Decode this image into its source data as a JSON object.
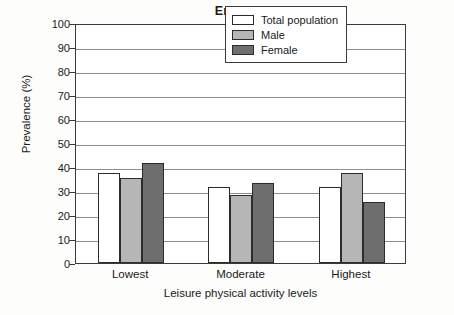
{
  "chart_data": {
    "type": "bar",
    "title": "England",
    "xlabel": "Leisure physical activity levels",
    "ylabel": "Prevalence (%)",
    "categories": [
      "Lowest",
      "Moderate",
      "Highest"
    ],
    "series": [
      {
        "name": "Total population",
        "values": [
          37.5,
          31.5,
          31.5
        ],
        "color": "#ffffff"
      },
      {
        "name": "Male",
        "values": [
          35.5,
          28.5,
          37.5
        ],
        "color": "#b6b6b6"
      },
      {
        "name": "Female",
        "values": [
          41.5,
          33.5,
          25.5
        ],
        "color": "#6e6e6e"
      }
    ],
    "ylim": [
      0,
      100
    ],
    "ytick_labels": [
      "100",
      "90",
      "80",
      "70",
      "60",
      "50",
      "40",
      "30",
      "20",
      "10",
      "0"
    ],
    "ytick_values": [
      100,
      90,
      80,
      70,
      60,
      50,
      40,
      30,
      20,
      10,
      0
    ],
    "grid": true,
    "legend_position": "top-right"
  },
  "legend": {
    "entries": [
      {
        "label": "Total population"
      },
      {
        "label": "Male"
      },
      {
        "label": "Female"
      }
    ]
  }
}
